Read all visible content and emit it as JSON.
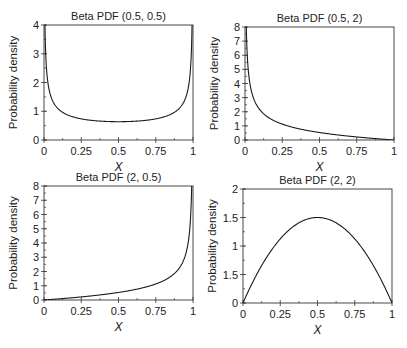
{
  "figure": {
    "width": 407,
    "height": 348,
    "line_color": "#1a1a1a",
    "axes_color": "#333333"
  },
  "chart_data": [
    {
      "type": "line",
      "title": "Beta PDF (0.5, 0.5)",
      "alpha": 0.5,
      "beta": 0.5,
      "xlabel": "X",
      "ylabel": "Probability density",
      "xlim": [
        0,
        1
      ],
      "ylim": [
        0,
        4
      ],
      "xticks": [
        0,
        0.25,
        0.5,
        0.75,
        1
      ],
      "xtick_labels": [
        "0",
        "0.25",
        "0.5",
        "0.75",
        "1"
      ],
      "yticks": [
        0,
        1,
        2,
        3,
        4
      ],
      "ytick_labels": [
        "0",
        "1",
        "2",
        "3",
        "4"
      ],
      "y_minor_step": 0.5,
      "grid": false,
      "box": [
        44,
        25,
        193,
        140
      ],
      "x": [
        0.0,
        0.02,
        0.05,
        0.1,
        0.25,
        0.5,
        0.75,
        0.9,
        0.95,
        0.98,
        1.0
      ],
      "y": [
        3.2,
        2.27,
        1.46,
        1.06,
        0.74,
        0.64,
        0.74,
        1.06,
        1.46,
        2.27,
        3.2
      ]
    },
    {
      "type": "line",
      "title": "Beta PDF (0.5, 2)",
      "alpha": 0.5,
      "beta": 2,
      "xlabel": "X",
      "ylabel": "Probability density",
      "xlim": [
        0,
        1
      ],
      "ylim": [
        0,
        8
      ],
      "xticks": [
        0,
        0.25,
        0.5,
        0.75,
        1
      ],
      "xtick_labels": [
        "0",
        "0.25",
        "0.5",
        "0.75",
        "1"
      ],
      "yticks": [
        0,
        1,
        2,
        3,
        4,
        5,
        6,
        7,
        8
      ],
      "ytick_labels": [
        "0",
        "1",
        "2",
        "3",
        "4",
        "5",
        "6",
        "7",
        "8"
      ],
      "y_minor_step": 0.5,
      "grid": false,
      "box": [
        245,
        27,
        394,
        140
      ],
      "x": [
        0.0,
        0.005,
        0.02,
        0.05,
        0.1,
        0.25,
        0.5,
        0.75,
        0.9,
        1.0
      ],
      "y": [
        7.5,
        7.46,
        3.68,
        2.24,
        1.42,
        0.75,
        0.35,
        0.13,
        0.05,
        0.0
      ]
    },
    {
      "type": "line",
      "title": "Beta PDF (2, 0.5)",
      "alpha": 2,
      "beta": 0.5,
      "xlabel": "X",
      "ylabel": "Probability density",
      "xlim": [
        0,
        1
      ],
      "ylim": [
        0,
        8
      ],
      "xticks": [
        0,
        0.25,
        0.5,
        0.75,
        1
      ],
      "xtick_labels": [
        "0",
        "0.25",
        "0.5",
        "0.75",
        "1"
      ],
      "yticks": [
        0,
        1,
        2,
        3,
        4,
        5,
        6,
        7,
        8
      ],
      "ytick_labels": [
        "0",
        "1",
        "2",
        "3",
        "4",
        "5",
        "6",
        "7",
        "8"
      ],
      "y_minor_step": 0.5,
      "grid": false,
      "box": [
        44,
        186,
        193,
        300
      ],
      "x": [
        0.0,
        0.1,
        0.25,
        0.5,
        0.75,
        0.9,
        0.95,
        0.98,
        0.995,
        1.0
      ],
      "y": [
        0.0,
        0.05,
        0.13,
        0.35,
        0.75,
        1.42,
        2.24,
        3.68,
        7.46,
        7.5
      ]
    },
    {
      "type": "line",
      "title": "Beta PDF (2, 2)",
      "alpha": 2,
      "beta": 2,
      "xlabel": "X",
      "ylabel": "Probability density",
      "xlim": [
        0,
        1
      ],
      "ylim": [
        0,
        2
      ],
      "xticks": [
        0,
        0.25,
        0.5,
        0.75,
        1
      ],
      "xtick_labels": [
        "0",
        "0.25",
        "0.5",
        "0.75",
        "1"
      ],
      "yticks": [
        0,
        0.5,
        1,
        1.5,
        2
      ],
      "ytick_labels": [
        "0",
        "1.5",
        "1",
        "1.5",
        "2"
      ],
      "y_minor_step": 0.25,
      "grid": false,
      "box": [
        243,
        189,
        392,
        303
      ],
      "x": [
        0.0,
        0.1,
        0.25,
        0.4,
        0.5,
        0.6,
        0.75,
        0.9,
        1.0
      ],
      "y": [
        0.1,
        0.54,
        1.125,
        1.44,
        1.5,
        1.44,
        1.125,
        0.54,
        0.1
      ]
    }
  ]
}
